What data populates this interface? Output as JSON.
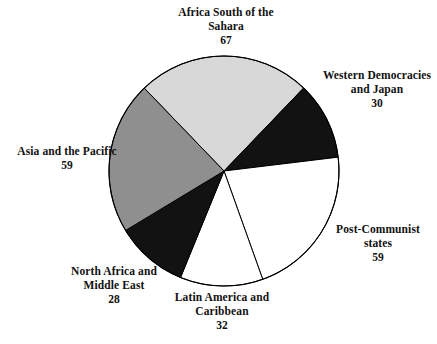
{
  "chart_data": {
    "type": "pie",
    "title": "",
    "total": 275,
    "start_angle_deg": -43.9,
    "direction": "clockwise",
    "center": {
      "x": 224,
      "y": 171
    },
    "radius": 115,
    "categories": [
      "Africa South of the Sahara",
      "Western Democracies and Japan",
      "Post-Communist states",
      "Latin America and Caribbean",
      "North Africa and Middle East",
      "Asia and the Pacific"
    ],
    "values": [
      67,
      30,
      59,
      32,
      28,
      59
    ],
    "colors": [
      "#d8d8d8",
      "#121212",
      "#ffffff",
      "#ffffff",
      "#121212",
      "#8f8f8f"
    ],
    "stroke": "#000000",
    "legend_position": "outside-labels",
    "grid": false,
    "slices": [
      {
        "label_line1": "Africa South of the",
        "label_line2": "Sahara",
        "value": "67",
        "color": "#d8d8d8"
      },
      {
        "label_line1": "Western Democracies",
        "label_line2": "and Japan",
        "value": "30",
        "color": "#121212"
      },
      {
        "label_line1": "Post-Communist",
        "label_line2": "states",
        "value": "59",
        "color": "#ffffff"
      },
      {
        "label_line1": "Latin America and",
        "label_line2": "Caribbean",
        "value": "32",
        "color": "#ffffff"
      },
      {
        "label_line1": "North Africa and",
        "label_line2": "Middle East",
        "value": "28",
        "color": "#121212"
      },
      {
        "label_line1": "Asia and the Pacific",
        "label_line2": "",
        "value": "59",
        "color": "#8f8f8f"
      }
    ]
  },
  "labels": {
    "africa": {
      "line1": "Africa South of the",
      "line2": "Sahara",
      "value": "67"
    },
    "western": {
      "line1": "Western Democracies",
      "line2": "and Japan",
      "value": "30"
    },
    "post_communist": {
      "line1": "Post-Communist",
      "line2": "states",
      "value": "59"
    },
    "latin": {
      "line1": "Latin America and",
      "line2": "Caribbean",
      "value": "32"
    },
    "north_africa": {
      "line1": "North Africa and",
      "line2": "Middle East",
      "value": "28"
    },
    "asia": {
      "line1": "Asia and the Pacific",
      "value": "59"
    }
  }
}
